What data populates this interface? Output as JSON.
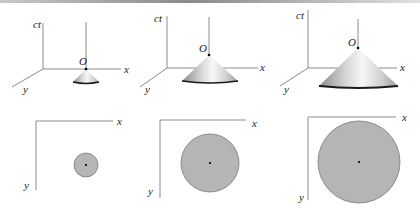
{
  "figure": {
    "panels": [
      {
        "id": "panel-1",
        "labels": {
          "time_axis": "ct",
          "origin": "O",
          "x_axis": "x",
          "y_axis": "y"
        },
        "cone_size": "small",
        "circle_size": "small"
      },
      {
        "id": "panel-2",
        "labels": {
          "time_axis": "ct",
          "origin": "O",
          "x_axis": "x",
          "y_axis": "y"
        },
        "cone_size": "medium",
        "circle_size": "medium"
      },
      {
        "id": "panel-3",
        "labels": {
          "time_axis": "ct",
          "origin": "O",
          "x_axis": "x",
          "y_axis": "y"
        },
        "cone_size": "large",
        "circle_size": "large"
      }
    ],
    "bottom_labels": [
      {
        "x_axis": "x",
        "y_axis": "y"
      },
      {
        "x_axis": "x",
        "y_axis": "y"
      },
      {
        "x_axis": "x",
        "y_axis": "y"
      }
    ],
    "colors": {
      "axis": "#8c8c8c",
      "disk_fill": "#b5b5b5",
      "disk_stroke": "#7a7a7a",
      "cone_light": "#f4f4f4",
      "cone_dark": "#8a8a8a",
      "cone_base": "#1a1a1a"
    }
  }
}
